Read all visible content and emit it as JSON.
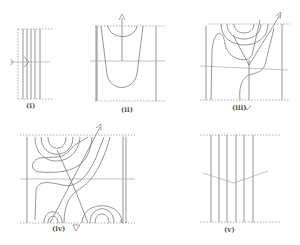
{
  "figure": {
    "panels": [
      {
        "id": "i",
        "label": "(i)",
        "description": "Parallel vertical lines with a horizontal line and a single arrowhead pointing right"
      },
      {
        "id": "ii",
        "label": "(ii)",
        "description": "U-shaped level curves with vertical flow line and upward arrow at top"
      },
      {
        "id": "iii",
        "label": "(iii)",
        "description": "Concentric arcs at top, wavy curve, diagonal arrow to upper right, downward arrow below"
      },
      {
        "id": "iv",
        "label": "(iv)",
        "description": "Concentric arcs top-left and bottom, wavy curves, diagonal arrow upper right, downward arrow below"
      },
      {
        "id": "v",
        "label": "(v)",
        "description": "Parallel vertical lines crossed by a shallow V-shaped line"
      }
    ],
    "colors": {
      "line": "#7a7a7a",
      "dashed": "#9a9a9a",
      "label": "#555555"
    }
  }
}
